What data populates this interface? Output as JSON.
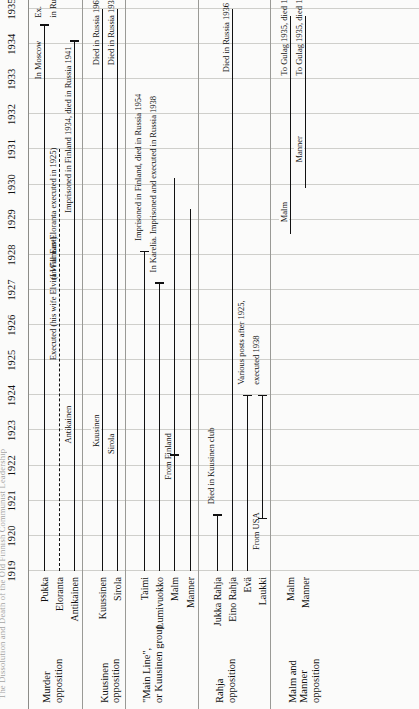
{
  "figure": {
    "cutoff_title": "The Dissolution and Death of the Old Finnish Communist Leadership",
    "orientation": "rotated-90"
  },
  "chart_data": {
    "type": "table",
    "title": "",
    "xlabel": "",
    "ylabel": "",
    "xlim": [
      1919,
      1935
    ],
    "grid": true,
    "legend": "none",
    "years": [
      1919,
      1920,
      1921,
      1922,
      1923,
      1924,
      1925,
      1926,
      1927,
      1928,
      1929,
      1930,
      1931,
      1932,
      1933,
      1934,
      1935
    ],
    "groups": [
      {
        "name": "Murder\nopposition",
        "name_lines": [
          "Murder",
          "opposition"
        ],
        "rows": [
          {
            "label": "Pukka",
            "start": 1919,
            "end": 1934.55,
            "style": "solid",
            "start_cap": false,
            "end_cap": true,
            "notes": [
              {
                "text": "In Moscow",
                "at": 1933.0
              },
              {
                "text": "Ex.",
                "at": 1934.75
              },
              {
                "text": "in Russia",
                "at": 1934.75,
                "line": 2
              }
            ]
          },
          {
            "label": "Eloranta",
            "start": 1919,
            "end": 1931.0,
            "style": "dashed",
            "start_cap": false,
            "end_cap": false,
            "notes": [
              {
                "text": "(In Far East)",
                "at": 1927.3
              },
              {
                "text": "Executed (his wife Elvira Willman-Eloranta executed in 1925)",
                "at": 1925.0
              }
            ]
          },
          {
            "label": "Antikainen",
            "start": 1919,
            "end": 1934.1,
            "style": "solid",
            "start_cap": false,
            "end_cap": true,
            "notes": [
              {
                "text": "Imprisoned in Finland 1934, died in Russia 1941",
                "at": 1929.2
              }
            ],
            "inline_label": {
              "text": "Antikainen",
              "at": 1922.6
            }
          }
        ]
      },
      {
        "name": "Kuusinen\nopposition",
        "name_lines": [
          "Kuusinen",
          "opposition"
        ],
        "rows": [
          {
            "label": "Kuussinen",
            "label_display": "Kuussinen",
            "start": 1919,
            "end": 1935.0,
            "style": "solid",
            "start_cap": false,
            "end_cap": false,
            "notes": [
              {
                "text": "Died in Russia 1964",
                "at": 1933.4
              }
            ],
            "inline_label": {
              "text": "Kuusinen",
              "at": 1922.5
            }
          },
          {
            "label": "Sirola",
            "start": 1919,
            "end": 1935.0,
            "style": "solid",
            "start_cap": false,
            "end_cap": false,
            "notes": [
              {
                "text": "Died in Russia 1936",
                "at": 1933.4
              }
            ],
            "inline_label": {
              "text": "Sirola",
              "at": 1922.3
            }
          }
        ]
      },
      {
        "name": "\"Main Line\",\nor Kuusinen group",
        "name_lines": [
          "\"Main Line\",",
          "or Kuusinen group"
        ],
        "rows": [
          {
            "label": "Taimi",
            "start": 1919,
            "end": 1928.1,
            "style": "solid",
            "start_cap": false,
            "end_cap": true,
            "notes": [
              {
                "text": "Imprisoned in Finland, died in Russia 1954",
                "at": 1928.4
              }
            ]
          },
          {
            "label": "Lumivuokko",
            "start": 1919,
            "end": 1927.2,
            "style": "solid",
            "start_cap": false,
            "end_cap": true,
            "notes": [
              {
                "text": "In Karelia. Imprisoned and executed in Russia 1938",
                "at": 1927.5
              }
            ]
          },
          {
            "label": "Malm",
            "start": 1919,
            "end": 1930.2,
            "style": "solid",
            "start_cap": false,
            "end_cap": false,
            "notes": [
              {
                "text": "From Finland",
                "at": 1921.6
              }
            ],
            "start_cap_at": 1922.3
          },
          {
            "label": "Manner",
            "start": 1919,
            "end": 1929.3,
            "style": "solid",
            "start_cap": false,
            "end_cap": false
          }
        ]
      },
      {
        "name": "Rahja\nopposition",
        "name_lines": [
          "Rahja",
          "opposition"
        ],
        "rows": [
          {
            "label": "Jukka Rahja",
            "start": 1919,
            "end": 1920.6,
            "style": "solid",
            "start_cap": false,
            "end_cap": true,
            "notes": [
              {
                "text": "Died in Kuusinen club",
                "at": 1920.9
              }
            ]
          },
          {
            "label": "Eino Rahja",
            "start": 1919,
            "end": 1935.0,
            "style": "solid",
            "start_cap": false,
            "end_cap": false,
            "notes": [
              {
                "text": "Died in Russia 1936",
                "at": 1933.2
              }
            ]
          },
          {
            "label": "Evä",
            "start": 1919,
            "end": 1924.0,
            "style": "solid",
            "start_cap": false,
            "end_cap": true,
            "notes": [
              {
                "text": "Various posts after 1925,",
                "at": 1924.3
              },
              {
                "text": "executed 1938",
                "at": 1924.3,
                "line": 2
              }
            ]
          },
          {
            "label": "Laukki",
            "start": 1920.5,
            "end": 1924.0,
            "style": "solid",
            "start_cap": true,
            "end_cap": true,
            "notes": [
              {
                "text": "From USA",
                "at": 1919.6
              }
            ]
          }
        ]
      },
      {
        "name": "Malm and\nManner\nopposition",
        "name_lines": [
          "Malm and",
          "Manner",
          "opposition"
        ],
        "rows": [
          {
            "label": "Malm",
            "start": 1928.6,
            "end": 1934.8,
            "style": "solid",
            "start_cap": false,
            "end_cap": false,
            "notes": [
              {
                "text": "To Gulag 1935, died 1938",
                "at": 1933.1
              }
            ],
            "inline_label": {
              "text": "Malm",
              "at": 1928.9
            }
          },
          {
            "label": "Manner",
            "start": 1929.9,
            "end": 1934.8,
            "style": "solid",
            "start_cap": false,
            "end_cap": false,
            "notes": [
              {
                "text": "To Gulag 1935, died 1939",
                "at": 1933.1
              }
            ],
            "inline_label": {
              "text": "Manner",
              "at": 1930.6
            }
          }
        ]
      }
    ]
  }
}
